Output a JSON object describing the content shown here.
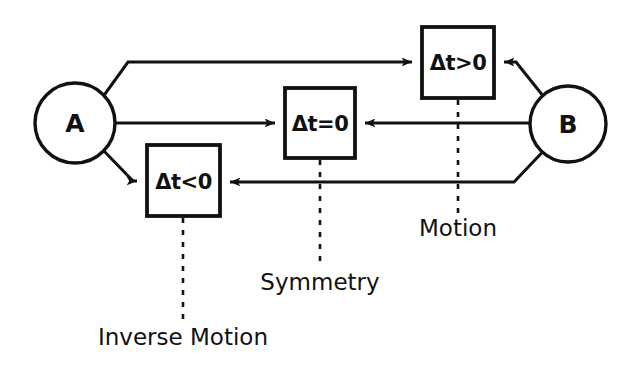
{
  "figure": {
    "type": "diagram",
    "subtype": "node-link-flow",
    "background_color": "#ffffff",
    "stroke_color": "#111111",
    "width": 637,
    "height": 370
  },
  "nodes": [
    {
      "id": "A",
      "label": "A",
      "shape": "circle",
      "cx": 75,
      "cy": 123,
      "r": 40
    },
    {
      "id": "B",
      "label": "B",
      "shape": "circle",
      "cx": 568,
      "cy": 124,
      "r": 38
    }
  ],
  "boxes": [
    {
      "id": "dt_gt_0",
      "label": "Δt>0",
      "shape": "rect",
      "x": 422,
      "y": 27,
      "w": 72,
      "h": 71,
      "cx": 458,
      "cy": 62
    },
    {
      "id": "dt_eq_0",
      "label": "Δt=0",
      "shape": "rect",
      "x": 285,
      "y": 88,
      "w": 70,
      "h": 70,
      "cx": 320,
      "cy": 123
    },
    {
      "id": "dt_lt_0",
      "label": "Δt<0",
      "shape": "rect",
      "x": 147,
      "y": 145,
      "w": 73,
      "h": 71,
      "cx": 183,
      "cy": 181
    }
  ],
  "edges": [
    {
      "id": "a-to-dt-gt-0",
      "from": "A",
      "to": "dt_gt_0",
      "arrow_at": "to",
      "description": "A upward polyline to Δt>0 box left side"
    },
    {
      "id": "a-to-dt-eq-0",
      "from": "A",
      "to": "dt_eq_0",
      "arrow_at": "to",
      "description": "A horizontal to Δt=0 box left side"
    },
    {
      "id": "a-to-dt-lt-0",
      "from": "A",
      "to": "dt_lt_0",
      "arrow_at": "to",
      "description": "A downward polyline to Δt<0 box left side"
    },
    {
      "id": "b-to-dt-gt-0",
      "from": "B",
      "to": "dt_gt_0",
      "arrow_at": "to",
      "description": "B upward polyline to Δt>0 box right side"
    },
    {
      "id": "b-to-dt-eq-0",
      "from": "B",
      "to": "dt_eq_0",
      "arrow_at": "to",
      "description": "B horizontal to Δt=0 box right side"
    },
    {
      "id": "b-to-dt-lt-0",
      "from": "B",
      "to": "dt_lt_0",
      "arrow_at": "to",
      "description": "B downward polyline to Δt<0 box right side"
    }
  ],
  "callouts": [
    {
      "id": "motion",
      "text": "Motion",
      "target_box": "dt_gt_0",
      "leader_x": 458,
      "leader_y1": 100,
      "leader_y2": 215,
      "label_x": 458,
      "label_y": 229
    },
    {
      "id": "symmetry",
      "text": "Symmetry",
      "target_box": "dt_eq_0",
      "leader_x": 320,
      "leader_y1": 160,
      "leader_y2": 267,
      "label_x": 320,
      "label_y": 283
    },
    {
      "id": "inverse-motion",
      "text": "Inverse Motion",
      "target_box": "dt_lt_0",
      "leader_x": 183,
      "leader_y1": 218,
      "leader_y2": 322,
      "label_x": 183,
      "label_y": 338
    }
  ]
}
